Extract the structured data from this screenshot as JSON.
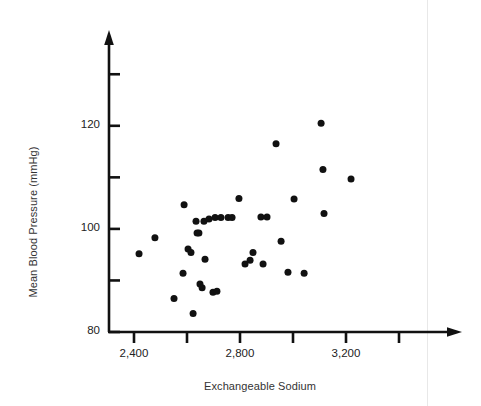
{
  "figure": {
    "background_color": "#ffffff",
    "ink_color": "#111111"
  },
  "labels": {
    "y_axis_title": "Mean Blood Pressure (mmHg)",
    "x_axis_title": "Exchangeable Sodium"
  },
  "axes": {
    "y_tick_labels": [
      "120",
      "100",
      "80"
    ],
    "x_tick_labels": [
      "2,400",
      "2,800",
      "3,200"
    ]
  },
  "chart_data": {
    "type": "scatter",
    "title": "",
    "xlabel": "Exchangeable Sodium",
    "ylabel": "Mean Blood Pressure (mmHg)",
    "xlim": [
      2280,
      3540
    ],
    "ylim": [
      80,
      130
    ],
    "grid": false,
    "legend": null,
    "x_ticks": [
      2400,
      2600,
      2800,
      3000,
      3200,
      3400
    ],
    "x_ticks_labeled": [
      2400,
      2800,
      3200
    ],
    "x_tick_labels": [
      "2,400",
      "2,800",
      "3,200"
    ],
    "y_ticks": [
      80,
      90,
      100,
      110,
      120,
      130
    ],
    "y_ticks_labeled": [
      80,
      100,
      120
    ],
    "y_tick_labels": [
      "80",
      "100",
      "120"
    ],
    "marker": "filled-circle",
    "marker_color": "#111111",
    "marker_size_px": 7,
    "points": [
      {
        "x": 2419,
        "y": 95.2
      },
      {
        "x": 2479,
        "y": 98.3
      },
      {
        "x": 2551,
        "y": 86.5
      },
      {
        "x": 2585,
        "y": 91.4
      },
      {
        "x": 2589,
        "y": 104.7
      },
      {
        "x": 2604,
        "y": 96.1
      },
      {
        "x": 2615,
        "y": 95.4
      },
      {
        "x": 2623,
        "y": 83.6
      },
      {
        "x": 2634,
        "y": 101.5
      },
      {
        "x": 2638,
        "y": 99.2
      },
      {
        "x": 2645,
        "y": 99.2
      },
      {
        "x": 2649,
        "y": 89.3
      },
      {
        "x": 2657,
        "y": 88.6
      },
      {
        "x": 2664,
        "y": 101.5
      },
      {
        "x": 2668,
        "y": 94.1
      },
      {
        "x": 2683,
        "y": 101.9
      },
      {
        "x": 2698,
        "y": 87.7
      },
      {
        "x": 2706,
        "y": 102.2
      },
      {
        "x": 2713,
        "y": 87.9
      },
      {
        "x": 2728,
        "y": 102.2
      },
      {
        "x": 2755,
        "y": 102.2
      },
      {
        "x": 2770,
        "y": 102.2
      },
      {
        "x": 2796,
        "y": 105.9
      },
      {
        "x": 2819,
        "y": 93.2
      },
      {
        "x": 2838,
        "y": 93.9
      },
      {
        "x": 2849,
        "y": 95.4
      },
      {
        "x": 2879,
        "y": 102.3
      },
      {
        "x": 2887,
        "y": 93.2
      },
      {
        "x": 2902,
        "y": 102.3
      },
      {
        "x": 2936,
        "y": 116.5
      },
      {
        "x": 2955,
        "y": 97.6
      },
      {
        "x": 2981,
        "y": 91.6
      },
      {
        "x": 3004,
        "y": 105.8
      },
      {
        "x": 3042,
        "y": 91.4
      },
      {
        "x": 3106,
        "y": 120.5
      },
      {
        "x": 3113,
        "y": 111.5
      },
      {
        "x": 3117,
        "y": 103.0
      },
      {
        "x": 3219,
        "y": 109.7
      }
    ]
  }
}
